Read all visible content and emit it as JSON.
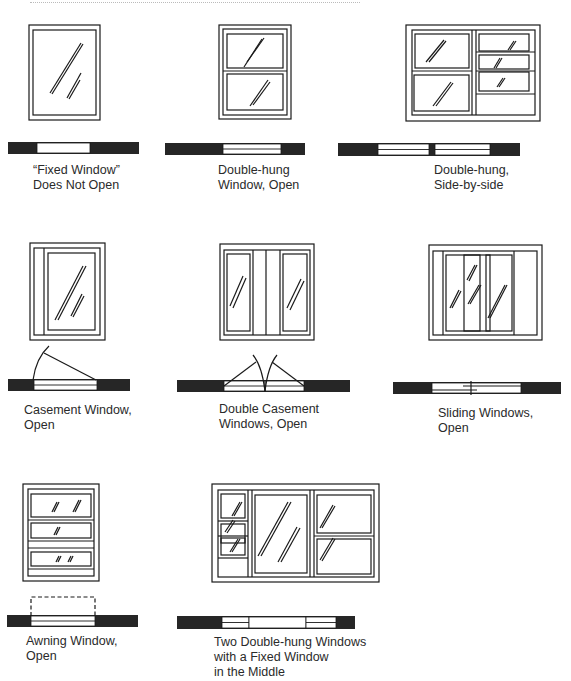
{
  "title_partial": "",
  "figures": [
    {
      "id": "fixed",
      "caption": [
        "“Fixed Window”",
        "Does Not Open"
      ]
    },
    {
      "id": "double-hung",
      "caption": [
        "Double-hung",
        "Window, Open"
      ]
    },
    {
      "id": "double-hung-side",
      "caption": [
        "Double-hung,",
        "Side-by-side"
      ]
    },
    {
      "id": "casement",
      "caption": [
        "Casement Window,",
        "Open"
      ]
    },
    {
      "id": "double-casement",
      "caption": [
        "Double Casement",
        "Windows, Open"
      ]
    },
    {
      "id": "sliding",
      "caption": [
        "Sliding Windows,",
        "Open"
      ]
    },
    {
      "id": "awning",
      "caption": [
        "Awning Window,",
        "Open"
      ]
    },
    {
      "id": "combo",
      "caption": [
        "Two Double-hung Windows",
        "with a Fixed Window",
        "in the Middle"
      ]
    }
  ],
  "colors": {
    "ink": "#1a1a1a",
    "wall": "#262626",
    "paper": "#ffffff"
  }
}
